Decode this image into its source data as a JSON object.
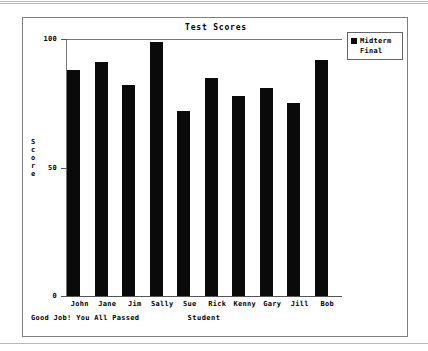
{
  "chart_data": {
    "type": "bar",
    "title": "Test Scores",
    "xlabel": "Student",
    "ylabel": "Score",
    "ylim": [
      0,
      100
    ],
    "yticks": [
      0,
      50,
      100
    ],
    "ytick_labels": [
      "0",
      "50",
      "100"
    ],
    "grid": false,
    "legend_position": "upper right",
    "annotation": "Good Job! You All Passed",
    "categories": [
      "John",
      "Jane",
      "Jim",
      "Sally",
      "Sue",
      "Rick",
      "Kenny",
      "Gary",
      "Jill",
      "Bob"
    ],
    "series": [
      {
        "name": "Midterm",
        "color": "#0a0a0a",
        "values": [
          88,
          91,
          82,
          99,
          72,
          85,
          78,
          81,
          75,
          92
        ]
      },
      {
        "name": "Final",
        "color": "#ffffff",
        "values": [
          0,
          0,
          0,
          0,
          0,
          0,
          0,
          0,
          0,
          0
        ]
      }
    ]
  },
  "legend": {
    "entries": [
      {
        "label": "Midterm",
        "color": "#0a0a0a"
      },
      {
        "label": "Final",
        "color": "#ffffff"
      }
    ]
  },
  "ylabel_letters": [
    "S",
    "c",
    "o",
    "r",
    "e"
  ]
}
